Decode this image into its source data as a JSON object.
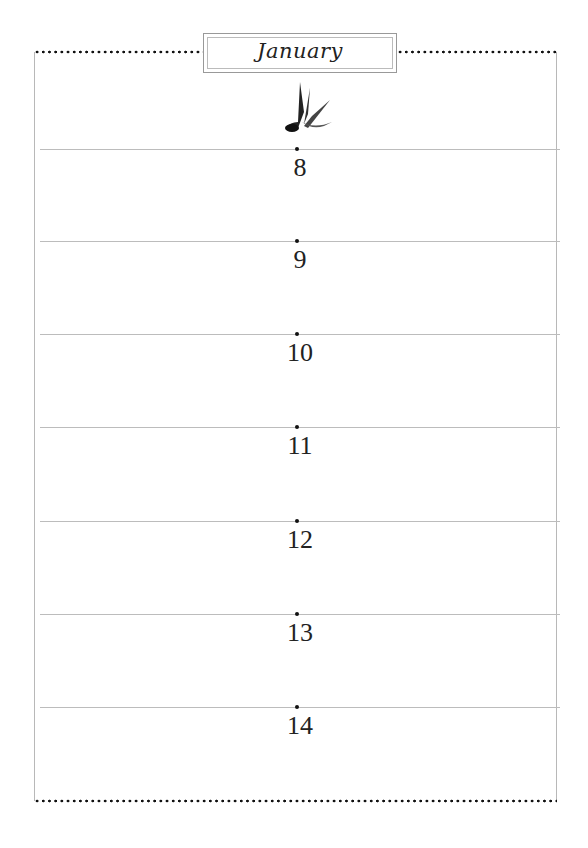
{
  "header": {
    "month": "January"
  },
  "days": [
    {
      "number": "8"
    },
    {
      "number": "9"
    },
    {
      "number": "10"
    },
    {
      "number": "11"
    },
    {
      "number": "12"
    },
    {
      "number": "13"
    },
    {
      "number": "14"
    }
  ],
  "decoration": {
    "icon": "swallow-bird-icon"
  },
  "colors": {
    "rule": "#bcbcbc",
    "dots": "#111111",
    "text": "#222222"
  }
}
